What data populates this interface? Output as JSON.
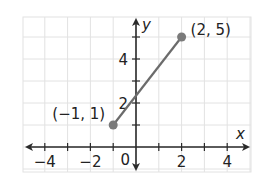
{
  "chart_data": {
    "type": "line",
    "title": "",
    "xlabel": "x",
    "ylabel": "y",
    "xlim": [
      -4.8,
      4.8
    ],
    "ylim": [
      -0.8,
      6
    ],
    "grid": true,
    "x_ticks": [
      -4,
      -3,
      -2,
      -1,
      1,
      2,
      3,
      4
    ],
    "x_tick_labels": [
      "-4",
      "-2",
      "2",
      "4"
    ],
    "x_tick_label_values": [
      -4,
      -2,
      2,
      4
    ],
    "y_ticks": [
      1,
      2,
      3,
      4,
      5
    ],
    "y_tick_labels": [
      "2",
      "4"
    ],
    "y_tick_label_values": [
      2,
      4
    ],
    "origin_label": "0",
    "series": [
      {
        "name": "segment",
        "x": [
          -1,
          2
        ],
        "y": [
          1,
          5
        ],
        "color": "#6b6b6b"
      }
    ],
    "points": [
      {
        "x": -1,
        "y": 1,
        "label": "(−1, 1)"
      },
      {
        "x": 2,
        "y": 5,
        "label": "(2, 5)"
      }
    ]
  },
  "colors": {
    "grid": "#e2e2e2",
    "axis": "#2a2a2a",
    "segment": "#6b6b6b",
    "point": "#7a7a7a"
  }
}
